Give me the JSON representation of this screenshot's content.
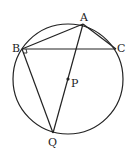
{
  "diagram": {
    "type": "geometry-circle",
    "circle": {
      "cx": 68,
      "cy": 79,
      "r": 55
    },
    "points": {
      "A": {
        "label": "A",
        "x": 83,
        "y": 24
      },
      "B": {
        "label": "B",
        "x": 22,
        "y": 49
      },
      "C": {
        "label": "C",
        "x": 116,
        "y": 49
      },
      "P": {
        "label": "P",
        "x": 68,
        "y": 79
      },
      "Q": {
        "label": "Q",
        "x": 53,
        "y": 133
      }
    },
    "segments": [
      "AB",
      "AC",
      "BC",
      "BQ",
      "AQ"
    ],
    "right_angle_at": "B",
    "colors": {
      "stroke": "#222222",
      "background": "#ffffff"
    }
  }
}
